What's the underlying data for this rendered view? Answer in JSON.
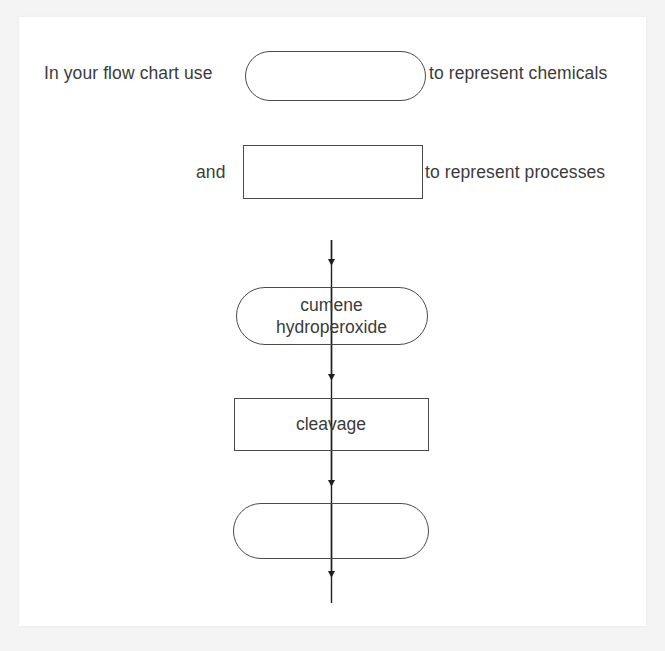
{
  "document": {
    "title": "Flow Chart Worksheet",
    "background_color": "#f4f4f5",
    "page_color": "#ffffff",
    "ink_color": "#3b3b3b",
    "stroke_color": "#4a4a4a"
  },
  "legend": {
    "chemical": {
      "prefix": "In your flow chart use",
      "suffix": "to represent chemicals",
      "shape": "stadium",
      "shape_label": ""
    },
    "process": {
      "prefix": "and",
      "suffix": "to represent processes",
      "shape": "rectangle",
      "shape_label": ""
    }
  },
  "flowchart": {
    "nodes": [
      {
        "id": "chemical-in",
        "shape": "stadium",
        "label": "cumene\nhydroperoxide",
        "line1": "cumene",
        "line2": "hydroperoxide"
      },
      {
        "id": "process",
        "shape": "rectangle",
        "label": "cleavage"
      },
      {
        "id": "chemical-out",
        "shape": "stadium",
        "label": ""
      }
    ],
    "connectors": [
      {
        "id": "inlet-arrow",
        "from": "",
        "to": "chemical-in",
        "direction": "down"
      },
      {
        "id": "chemical-in-to-process",
        "from": "chemical-in",
        "to": "process",
        "direction": "down"
      },
      {
        "id": "process-to-chemical-out",
        "from": "process",
        "to": "chemical-out",
        "direction": "down"
      },
      {
        "id": "outlet-arrow",
        "from": "chemical-out",
        "to": "",
        "direction": "down"
      }
    ]
  }
}
